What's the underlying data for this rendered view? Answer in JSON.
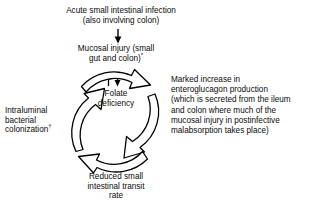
{
  "diagram": {
    "flow_direction": "clockwise",
    "stroke_color": "#000000",
    "background_color": "#ffffff",
    "nodes": {
      "infection": {
        "label": "Acute small intestinal infection\n(also involving colon)"
      },
      "mucosal_injury": {
        "label_line1": "Mucosal injury (small",
        "label_line2": "gut and colon)",
        "marker": "*"
      },
      "folate_deficiency": {
        "label": "Folate\ndeficiency"
      },
      "enteroglucagon": {
        "label": "Marked increase in\nenteroglucagon production\n(which is secreted from the ileum\nand colon where much of the\nmucosal injury in postinfective\nmalabsorption takes place)"
      },
      "intraluminal": {
        "label_line1": "Intraluminal",
        "label_line2": "bacterial",
        "label_line3": "colonization",
        "marker": "†"
      },
      "transit": {
        "label": "Reduced small\nintestinal transit\nrate"
      }
    },
    "arrows": {
      "infection_to_mucosal": "down-arrow",
      "folate_exchange": "up-down-double-arrow",
      "cycle_top_right": "curved-arrow-clockwise",
      "cycle_bottom_right": "curved-arrow-clockwise",
      "cycle_bottom_left": "curved-arrow-clockwise",
      "cycle_top_left": "curved-arrow-clockwise"
    }
  }
}
